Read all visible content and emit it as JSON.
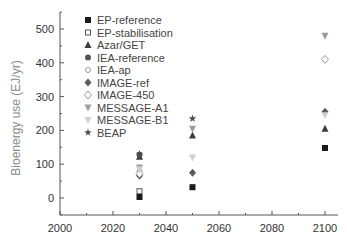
{
  "chart_data": {
    "type": "scatter",
    "title": "",
    "xlabel": "",
    "ylabel": "Bioenergy use (EJ/yr)",
    "xlim": [
      2000,
      2105
    ],
    "ylim": [
      -50,
      550
    ],
    "x_ticks": [
      2000,
      2020,
      2040,
      2060,
      2080,
      2100
    ],
    "y_ticks": [
      0,
      100,
      200,
      300,
      400,
      500
    ],
    "grid": false,
    "legend_position": "upper-left inside",
    "series": [
      {
        "name": "EP-reference",
        "marker": "square-filled",
        "color": "#1a1a1a",
        "points": [
          [
            2030,
            3
          ],
          [
            2050,
            32
          ],
          [
            2100,
            148
          ]
        ]
      },
      {
        "name": "EP-stabilisation",
        "marker": "square-open",
        "color": "#555555",
        "points": [
          [
            2030,
            20
          ]
        ]
      },
      {
        "name": "Azar/GET",
        "marker": "triangle-filled",
        "color": "#3c3c3c",
        "points": [
          [
            2030,
            122
          ],
          [
            2050,
            185
          ],
          [
            2100,
            205
          ]
        ]
      },
      {
        "name": "IEA-reference",
        "marker": "circle-filled",
        "color": "#555555",
        "points": [
          [
            2030,
            128
          ]
        ]
      },
      {
        "name": "IEA-ap",
        "marker": "circle-open",
        "color": "#9a9a9a",
        "points": [
          [
            2030,
            80
          ]
        ]
      },
      {
        "name": "IMAGE-ref",
        "marker": "diamond-filled",
        "color": "#5a5a5a",
        "points": [
          [
            2030,
            66
          ],
          [
            2050,
            75
          ],
          [
            2100,
            255
          ]
        ]
      },
      {
        "name": "IMAGE-450",
        "marker": "diamond-open",
        "color": "#9a9a9a",
        "points": [
          [
            2030,
            72
          ],
          [
            2100,
            410
          ]
        ]
      },
      {
        "name": "MESSAGE-A1",
        "marker": "triangle-down-filled",
        "color": "#9c9c9c",
        "points": [
          [
            2030,
            90
          ],
          [
            2050,
            205
          ],
          [
            2100,
            480
          ]
        ]
      },
      {
        "name": "MESSAGE-B1",
        "marker": "triangle-down-open",
        "color": "#d0d0d0",
        "points": [
          [
            2030,
            85
          ],
          [
            2050,
            120
          ],
          [
            2100,
            245
          ]
        ]
      },
      {
        "name": "BEAP",
        "marker": "star",
        "color": "#4a4a4a",
        "points": [
          [
            2030,
            130
          ],
          [
            2050,
            235
          ]
        ]
      }
    ]
  },
  "legend": {
    "items": [
      "EP-reference",
      "EP-stabilisation",
      "Azar/GET",
      "IEA-reference",
      "IEA-ap",
      "IMAGE-ref",
      "IMAGE-450",
      "MESSAGE-A1",
      "MESSAGE-B1",
      "BEAP"
    ]
  },
  "axes": {
    "ylabel": "Bioenergy use (EJ/yr)",
    "x_tick_labels": [
      "2000",
      "2020",
      "2040",
      "2060",
      "2080",
      "2100"
    ],
    "y_tick_labels": [
      "0",
      "100",
      "200",
      "300",
      "400",
      "500"
    ]
  },
  "colors": {
    "axis": "#555555",
    "tick_text": "#333333",
    "ylabel_text": "#8a8a8a"
  }
}
